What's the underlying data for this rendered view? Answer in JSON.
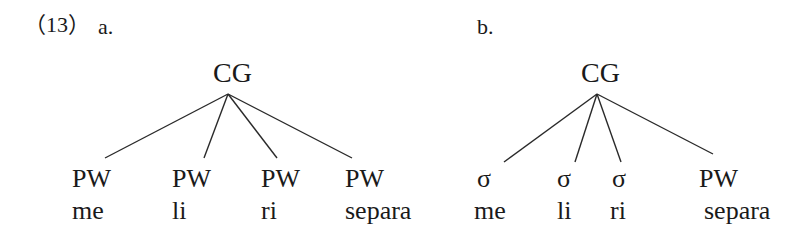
{
  "example": {
    "number": "（13）",
    "panels": [
      {
        "label": "a.",
        "root": "CG",
        "children": [
          {
            "node": "PW",
            "word": "me"
          },
          {
            "node": "PW",
            "word": "li"
          },
          {
            "node": "PW",
            "word": "ri"
          },
          {
            "node": "PW",
            "word": "separa"
          }
        ]
      },
      {
        "label": "b.",
        "root": "CG",
        "children": [
          {
            "node": "σ",
            "word": "me"
          },
          {
            "node": "σ",
            "word": "li"
          },
          {
            "node": "σ",
            "word": "ri"
          },
          {
            "node": "PW",
            "word": "separa"
          }
        ]
      }
    ]
  },
  "colors": {
    "text": "#1a1a1a",
    "lines": "#2a2a2a",
    "background": "#ffffff"
  }
}
